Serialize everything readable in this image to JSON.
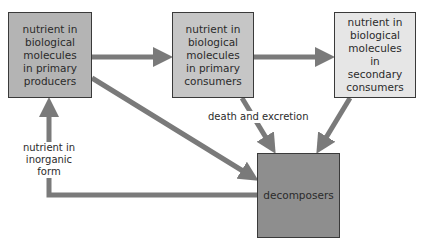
{
  "diagram": {
    "type": "nutrient-cycle-flow",
    "nodes": [
      {
        "id": "producers",
        "label": "nutrient in biological molecules in primary producers",
        "lines": [
          "nutrient in",
          "biological",
          "molecules",
          "in primary",
          "producers"
        ],
        "fill": "#b4b4b4"
      },
      {
        "id": "primary_consumers",
        "label": "nutrient in biological molecules in primary consumers",
        "lines": [
          "nutrient in",
          "biological",
          "molecules",
          "in primary",
          "consumers"
        ],
        "fill": "#c6c6c6"
      },
      {
        "id": "secondary_consumers",
        "label": "nutrient in biological molecules in secondary consumers",
        "lines": [
          "nutrient in",
          "biological",
          "molecules in",
          "secondary",
          "consumers"
        ],
        "fill": "#e6e6e6"
      },
      {
        "id": "decomposers",
        "label": "decomposers",
        "lines": [
          "decomposers"
        ],
        "fill": "#8e8e8e"
      }
    ],
    "edges": [
      {
        "from": "producers",
        "to": "primary_consumers",
        "label": ""
      },
      {
        "from": "primary_consumers",
        "to": "secondary_consumers",
        "label": ""
      },
      {
        "from": "producers",
        "to": "decomposers",
        "label": ""
      },
      {
        "from": "primary_consumers",
        "to": "decomposers",
        "label": "death and excretion"
      },
      {
        "from": "secondary_consumers",
        "to": "decomposers",
        "label": ""
      },
      {
        "from": "decomposers",
        "to": "producers",
        "label": "nutrient in inorganic form"
      }
    ],
    "labels": {
      "death_excretion": "death and excretion",
      "inorganic_line1": "nutrient in",
      "inorganic_line2": "inorganic form"
    },
    "arrow_color": "#7a7a7a"
  }
}
